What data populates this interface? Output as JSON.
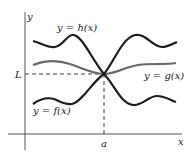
{
  "figure": {
    "type": "squeeze-theorem-illustration",
    "axes": {
      "x_label": "x",
      "y_label": "y"
    },
    "point_labels": {
      "limit_value": "L",
      "x_point": "a"
    },
    "curves": [
      {
        "id": "h",
        "label": "y = h(x)",
        "color": "#1e1e1e",
        "position": "upper"
      },
      {
        "id": "g",
        "label": "y = g(x)",
        "color": "#6a6a6a",
        "position": "middle"
      },
      {
        "id": "f",
        "label": "y = f(x)",
        "color": "#1e1e1e",
        "position": "lower"
      }
    ],
    "colors": {
      "axis": "#555555",
      "dashed_guide": "#444444",
      "background": "#ffffff"
    }
  }
}
